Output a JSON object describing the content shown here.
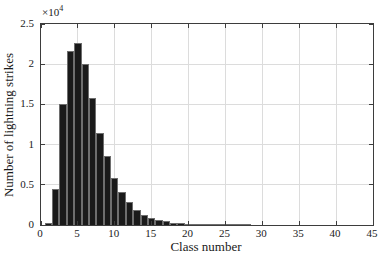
{
  "figure": {
    "background": "#ffffff"
  },
  "chart_data": {
    "type": "bar",
    "title": "",
    "xlabel": "Class number",
    "ylabel": "Number of lightning strikes",
    "y_axis_multiplier": {
      "base": "×10",
      "exponent": "4"
    },
    "categories": [
      1,
      2,
      3,
      4,
      5,
      6,
      7,
      8,
      9,
      10,
      11,
      12,
      13,
      14,
      15,
      16,
      17,
      18,
      19,
      20,
      21,
      22,
      23,
      24,
      25,
      26,
      27,
      28
    ],
    "values_x1e4": [
      0.03,
      0.45,
      1.5,
      2.17,
      2.26,
      2.0,
      1.58,
      1.15,
      0.86,
      0.59,
      0.41,
      0.28,
      0.19,
      0.13,
      0.09,
      0.06,
      0.045,
      0.03,
      0.02,
      0.015,
      0.012,
      0.01,
      0.008,
      0.006,
      0.005,
      0.004,
      0.003,
      0.003
    ],
    "bar_unit_width": 1,
    "xlim": [
      0,
      45
    ],
    "ylim": [
      0,
      2.5
    ],
    "xticks": [
      0,
      5,
      10,
      15,
      20,
      25,
      30,
      35,
      40,
      45
    ],
    "xtick_labels": [
      "0",
      "5",
      "10",
      "15",
      "20",
      "25",
      "30",
      "35",
      "40",
      "45"
    ],
    "yticks": [
      0,
      0.5,
      1,
      1.5,
      2,
      2.5
    ],
    "ytick_labels": [
      "0",
      "0.5",
      "1",
      "1.5",
      "2",
      "2.5"
    ],
    "grid": true,
    "legend_position": "none",
    "colors": {
      "bar_fill": "#1a1a1a",
      "bar_edge": "#6e6e6e",
      "grid": "#dcdcdc",
      "axis_box": "#3d3d3d",
      "text": "#1a1a1a",
      "background": "#ffffff"
    }
  }
}
